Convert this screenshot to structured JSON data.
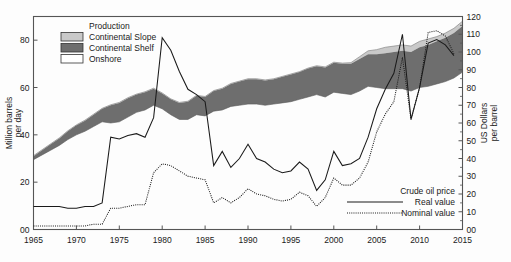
{
  "chart_data": {
    "type": "area",
    "title": "",
    "xlabel": "",
    "ylabel": "Million barrels per day",
    "y2label": "US Dollars per barrel",
    "xlim": [
      1965,
      2015
    ],
    "ylim": [
      0,
      90
    ],
    "y2lim": [
      0,
      120
    ],
    "grid": false,
    "x_ticks": [
      "1965",
      "1970",
      "1975",
      "1980",
      "1985",
      "1990",
      "1995",
      "2000",
      "2005",
      "2010",
      "2015"
    ],
    "x_tick_values": [
      1965,
      1970,
      1975,
      1980,
      1985,
      1990,
      1995,
      2000,
      2005,
      2010,
      2015
    ],
    "y_ticks": [
      "00",
      "20",
      "40",
      "60",
      "80"
    ],
    "y_tick_values": [
      0,
      20,
      40,
      60,
      80
    ],
    "y2_ticks": [
      "00",
      "10",
      "20",
      "30",
      "40",
      "50",
      "60",
      "70",
      "80",
      "90",
      "100",
      "110",
      "120"
    ],
    "y2_tick_values": [
      0,
      10,
      20,
      30,
      40,
      50,
      60,
      70,
      80,
      90,
      100,
      110,
      120
    ],
    "legend_production_title": "Production",
    "legend_position": "top-left",
    "legend_price_title": "Crude oil price",
    "colors": {
      "continental_slope": "#c9c9c9",
      "continental_shelf": "#6e6e6e",
      "onshore": "#ffffff",
      "line": "#1a1a1a",
      "frame": "#555555",
      "background": "#fdfdfd"
    },
    "series": [
      {
        "name": "Onshore",
        "kind": "band_boundary",
        "note": "lower edge of the stacked production band (top of the onshore wedge)",
        "x": [
          1965,
          1966,
          1967,
          1968,
          1969,
          1970,
          1971,
          1972,
          1973,
          1974,
          1975,
          1976,
          1977,
          1978,
          1979,
          1980,
          1981,
          1982,
          1983,
          1984,
          1985,
          1986,
          1987,
          1988,
          1989,
          1990,
          1991,
          1992,
          1993,
          1994,
          1995,
          1996,
          1997,
          1998,
          1999,
          2000,
          2001,
          2002,
          2003,
          2004,
          2005,
          2006,
          2007,
          2008,
          2009,
          2010,
          2011,
          2012,
          2013,
          2014,
          2015
        ],
        "values": [
          29.5,
          31.5,
          33.5,
          35.5,
          38.0,
          40.0,
          41.5,
          43.5,
          45.5,
          45.0,
          45.5,
          47.5,
          49.5,
          50.5,
          52.5,
          51.0,
          48.5,
          46.5,
          46.5,
          48.5,
          48.0,
          50.0,
          50.5,
          52.0,
          52.5,
          53.0,
          53.0,
          52.5,
          53.0,
          53.5,
          54.0,
          55.0,
          56.0,
          57.0,
          56.0,
          58.0,
          57.5,
          57.0,
          58.5,
          60.5,
          60.0,
          59.5,
          59.5,
          59.5,
          58.5,
          60.0,
          60.5,
          61.5,
          62.5,
          64.0,
          66.5
        ]
      },
      {
        "name": "Continental Shelf",
        "kind": "band_boundary",
        "note": "cumulative top of onshore + continental shelf",
        "x": [
          1965,
          1966,
          1967,
          1968,
          1969,
          1970,
          1971,
          1972,
          1973,
          1974,
          1975,
          1976,
          1977,
          1978,
          1979,
          1980,
          1981,
          1982,
          1983,
          1984,
          1985,
          1986,
          1987,
          1988,
          1989,
          1990,
          1991,
          1992,
          1993,
          1994,
          1995,
          1996,
          1997,
          1998,
          1999,
          2000,
          2001,
          2002,
          2003,
          2004,
          2005,
          2006,
          2007,
          2008,
          2009,
          2010,
          2011,
          2012,
          2013,
          2014,
          2015
        ],
        "values": [
          31.0,
          33.5,
          36.0,
          38.5,
          41.5,
          44.0,
          46.0,
          48.5,
          51.0,
          52.5,
          53.5,
          55.5,
          57.0,
          58.0,
          59.5,
          57.5,
          55.0,
          53.5,
          54.0,
          56.5,
          56.0,
          58.5,
          59.5,
          61.5,
          62.5,
          63.5,
          63.5,
          63.0,
          63.5,
          64.5,
          65.5,
          66.5,
          68.0,
          69.0,
          68.5,
          70.5,
          70.0,
          70.0,
          72.0,
          74.0,
          74.0,
          74.5,
          75.0,
          75.5,
          75.0,
          77.0,
          78.0,
          79.5,
          81.0,
          83.0,
          86.0
        ]
      },
      {
        "name": "Continental Slope",
        "kind": "band_boundary",
        "note": "cumulative total production (top of the full band); separates from shelf only after about 2003",
        "x": [
          1965,
          1966,
          1967,
          1968,
          1969,
          1970,
          1971,
          1972,
          1973,
          1974,
          1975,
          1976,
          1977,
          1978,
          1979,
          1980,
          1981,
          1982,
          1983,
          1984,
          1985,
          1986,
          1987,
          1988,
          1989,
          1990,
          1991,
          1992,
          1993,
          1994,
          1995,
          1996,
          1997,
          1998,
          1999,
          2000,
          2001,
          2002,
          2003,
          2004,
          2005,
          2006,
          2007,
          2008,
          2009,
          2010,
          2011,
          2012,
          2013,
          2014,
          2015
        ],
        "values": [
          31.2,
          33.7,
          36.2,
          38.7,
          41.7,
          44.2,
          46.2,
          48.7,
          51.2,
          52.7,
          53.7,
          55.7,
          57.2,
          58.2,
          59.7,
          57.7,
          55.2,
          53.7,
          54.2,
          56.7,
          56.2,
          58.7,
          59.7,
          61.7,
          62.7,
          63.7,
          63.7,
          63.2,
          63.7,
          64.7,
          65.7,
          66.7,
          68.2,
          69.2,
          68.7,
          70.7,
          70.3,
          70.5,
          73.0,
          75.5,
          76.0,
          77.0,
          77.5,
          78.0,
          77.5,
          79.5,
          80.5,
          81.5,
          83.0,
          85.0,
          88.0
        ]
      },
      {
        "name": "Real value",
        "kind": "line",
        "style": "solid",
        "axis": "right",
        "unit": "US Dollars per barrel",
        "x": [
          1965,
          1966,
          1967,
          1968,
          1969,
          1970,
          1971,
          1972,
          1973,
          1974,
          1975,
          1976,
          1977,
          1978,
          1979,
          1980,
          1981,
          1982,
          1983,
          1984,
          1985,
          1986,
          1987,
          1988,
          1989,
          1990,
          1991,
          1992,
          1993,
          1994,
          1995,
          1996,
          1997,
          1998,
          1999,
          2000,
          2001,
          2002,
          2003,
          2004,
          2005,
          2006,
          2007,
          2008,
          2009,
          2010,
          2011,
          2012,
          2013,
          2014
        ],
        "values": [
          13,
          13,
          13,
          13,
          12,
          12,
          13,
          13,
          15,
          52,
          51,
          53,
          54,
          52,
          63,
          108,
          101,
          89,
          79,
          76,
          72,
          36,
          44,
          35,
          40,
          48,
          40,
          38,
          34,
          32,
          33,
          38,
          34,
          22,
          28,
          44,
          36,
          37,
          40,
          52,
          68,
          79,
          88,
          110,
          62,
          80,
          105,
          107,
          104,
          98
        ]
      },
      {
        "name": "Nominal value",
        "kind": "line",
        "style": "dotted",
        "axis": "right",
        "unit": "US Dollars per barrel",
        "x": [
          1965,
          1966,
          1967,
          1968,
          1969,
          1970,
          1971,
          1972,
          1973,
          1974,
          1975,
          1976,
          1977,
          1978,
          1979,
          1980,
          1981,
          1982,
          1983,
          1984,
          1985,
          1986,
          1987,
          1988,
          1989,
          1990,
          1991,
          1992,
          1993,
          1994,
          1995,
          1996,
          1997,
          1998,
          1999,
          2000,
          2001,
          2002,
          2003,
          2004,
          2005,
          2006,
          2007,
          2008,
          2009,
          2010,
          2011,
          2012,
          2013,
          2014
        ],
        "values": [
          2,
          2,
          2,
          2,
          2,
          2,
          2,
          3,
          3,
          12,
          12,
          13,
          14,
          14,
          32,
          37,
          36,
          33,
          30,
          29,
          28,
          15,
          18,
          15,
          18,
          23,
          20,
          19,
          17,
          16,
          17,
          21,
          19,
          13,
          18,
          29,
          25,
          25,
          29,
          38,
          55,
          65,
          72,
          97,
          62,
          80,
          111,
          112,
          109,
          99
        ]
      }
    ]
  },
  "legend_production": {
    "title": "Production",
    "items": [
      {
        "label": "Continental Slope",
        "swatch": "#c9c9c9"
      },
      {
        "label": "Continental Shelf",
        "swatch": "#6e6e6e"
      },
      {
        "label": "Onshore",
        "swatch": "#ffffff"
      }
    ]
  },
  "legend_price": {
    "title": "Crude oil price",
    "items": [
      {
        "label": "Real value",
        "style": "solid"
      },
      {
        "label": "Nominal value",
        "style": "dotted"
      }
    ]
  },
  "axes": {
    "left_label_line1": "Million barrels",
    "left_label_line2": "per day",
    "right_label_line1": "US Dollars",
    "right_label_line2": "per barrel"
  }
}
